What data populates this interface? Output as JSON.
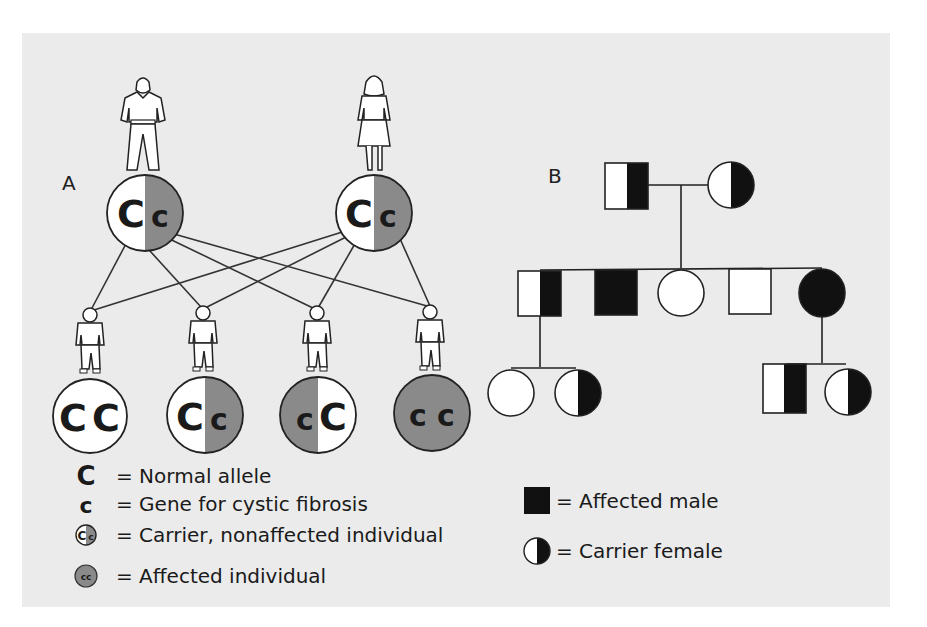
{
  "colors": {
    "background": "#ebebeb",
    "affected_gray": "#8a8a8a",
    "pedigree_black": "#111111",
    "line": "#333333"
  },
  "panel_a": {
    "label": "A",
    "parents": [
      {
        "figure": "man",
        "genotype": "Cc",
        "left_allele": "C",
        "right_allele": "c",
        "status": "carrier"
      },
      {
        "figure": "woman",
        "genotype": "Cc",
        "left_allele": "C",
        "right_allele": "c",
        "status": "carrier"
      }
    ],
    "children": [
      {
        "figure": "child",
        "genotype": "CC",
        "left_allele": "C",
        "right_allele": "C",
        "status": "normal"
      },
      {
        "figure": "child",
        "genotype": "Cc",
        "left_allele": "C",
        "right_allele": "c",
        "status": "carrier"
      },
      {
        "figure": "child",
        "genotype": "cC",
        "left_allele": "c",
        "right_allele": "C",
        "status": "carrier"
      },
      {
        "figure": "child",
        "genotype": "cc",
        "left_allele": "c",
        "right_allele": "c",
        "status": "affected"
      }
    ],
    "legend": [
      {
        "symbol": "C",
        "text": "= Normal allele"
      },
      {
        "symbol": "c",
        "text": "= Gene for cystic fibrosis"
      },
      {
        "symbol": "Cc",
        "text": "= Carrier, nonaffected individual"
      },
      {
        "symbol": "cc",
        "text": "= Affected individual"
      }
    ]
  },
  "panel_b": {
    "label": "B",
    "generation_1": [
      {
        "sex": "male",
        "status": "carrier"
      },
      {
        "sex": "female",
        "status": "carrier"
      }
    ],
    "generation_2": [
      {
        "sex": "male",
        "status": "carrier"
      },
      {
        "sex": "male",
        "status": "affected"
      },
      {
        "sex": "female",
        "status": "normal"
      },
      {
        "sex": "male",
        "status": "normal"
      },
      {
        "sex": "female",
        "status": "affected"
      }
    ],
    "generation_3": [
      {
        "sex": "female",
        "status": "normal",
        "parent_index": 0
      },
      {
        "sex": "female",
        "status": "carrier",
        "parent_index": 0
      },
      {
        "sex": "male",
        "status": "carrier",
        "parent_index": 4
      },
      {
        "sex": "female",
        "status": "carrier",
        "parent_index": 4
      }
    ],
    "legend": [
      {
        "symbol": "affected-male",
        "text": "= Affected male"
      },
      {
        "symbol": "carrier-female",
        "text": "= Carrier female"
      }
    ]
  }
}
